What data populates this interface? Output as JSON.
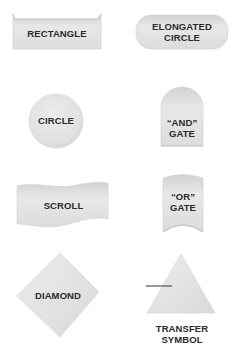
{
  "shapes": {
    "rectangle": {
      "label": "RECTANGLE"
    },
    "elongated_circle": {
      "line1": "ELONGATED",
      "line2": "CIRCLE"
    },
    "circle": {
      "label": "CIRCLE"
    },
    "and_gate": {
      "line1": "“AND”",
      "line2": "GATE"
    },
    "scroll": {
      "label": "SCROLL"
    },
    "or_gate": {
      "line1": "“OR”",
      "line2": "GATE"
    },
    "diamond": {
      "label": "DIAMOND"
    },
    "transfer_symbol": {
      "line1": "TRANSFER",
      "line2": "SYMBOL"
    }
  },
  "colors": {
    "fill": "#e4e4e4",
    "shade": "#c8c8c8",
    "text": "#2a2a2a"
  }
}
